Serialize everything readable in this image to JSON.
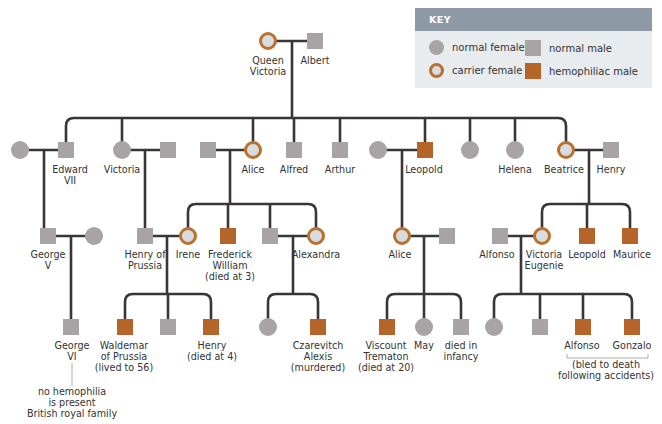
{
  "key": {
    "title": "KEY",
    "items": [
      {
        "label": "normal female",
        "symbol": "circle",
        "color": "#a8a3a4"
      },
      {
        "label": "normal male",
        "symbol": "square",
        "color": "#a8a3a4"
      },
      {
        "label": "carrier female",
        "symbol": "ringed-circle",
        "color": "#b8712f"
      },
      {
        "label": "hemophiliac male",
        "symbol": "square",
        "color": "#b5652a"
      }
    ]
  },
  "colors": {
    "normal": "#a8a3a4",
    "carrier_ring": "#b8712f",
    "carrier_fill": "#d9dcde",
    "hemophiliac": "#b5652a",
    "line": "#3a3536"
  },
  "generation1": {
    "queen_victoria": "Queen\nVictoria",
    "queen_victoria_l1": "Queen",
    "queen_victoria_l2": "Victoria",
    "albert": "Albert"
  },
  "generation2": {
    "edward_l1": "Edward",
    "edward_l2": "VII",
    "victoria": "Victoria",
    "alice": "Alice",
    "alfred": "Alfred",
    "arthur": "Arthur",
    "leopold": "Leopold",
    "helena": "Helena",
    "beatrice": "Beatrice",
    "henry": "Henry"
  },
  "generation3": {
    "george_v_l1": "George",
    "george_v_l2": "V",
    "henry_prussia_l1": "Henry of",
    "henry_prussia_l2": "Prussia",
    "irene": "Irene",
    "frederick_l1": "Frederick",
    "frederick_l2": "William",
    "frederick_l3": "(died at 3)",
    "alexandra": "Alexandra",
    "alice": "Alice",
    "alfonso": "Alfonso",
    "victoria_eugenie_l1": "Victoria",
    "victoria_eugenie_l2": "Eugenie",
    "leopold": "Leopold",
    "maurice": "Maurice"
  },
  "generation4": {
    "george_vi_l1": "George",
    "george_vi_l2": "VI",
    "waldemar_l1": "Waldemar",
    "waldemar_l2": "of Prussia",
    "waldemar_l3": "(lived to 56)",
    "henry_l1": "Henry",
    "henry_l2": "(died at 4)",
    "alexis_l1": "Czarevitch",
    "alexis_l2": "Alexis",
    "alexis_l3": "(murdered)",
    "trematon_l1": "Viscount",
    "trematon_l2": "Trematon",
    "trematon_l3": "(died at 20)",
    "may": "May",
    "infancy_l1": "died in",
    "infancy_l2": "infancy",
    "alfonso": "Alfonso",
    "gonzalo": "Gonzalo",
    "bled_l1": "(bled to death",
    "bled_l2": "following accidents)"
  },
  "note": {
    "l1": "no hemophilia",
    "l2": "is present",
    "l3": "British royal family"
  }
}
